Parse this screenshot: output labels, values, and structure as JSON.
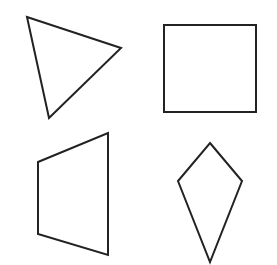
{
  "canvas": {
    "width": 277,
    "height": 265,
    "background_color": "#ffffff",
    "stroke_color": "#222222",
    "stroke_width": 2
  },
  "shapes": [
    {
      "name": "triangle",
      "description": "scalene triangle rotated, apex pointing right-down, top-left quadrant",
      "points": "27,17 121,48 49,118"
    },
    {
      "name": "square",
      "description": "axis-aligned square, top-right quadrant",
      "points": "164,25 256,25 256,112 164,112"
    },
    {
      "name": "trapezoid",
      "description": "quadrilateral with two vertical parallel sides, shorter left side, bottom-left quadrant",
      "points": "38,162 108,133 108,255 38,234"
    },
    {
      "name": "kite",
      "description": "kite-shaped quadrilateral, long point downward, bottom-right quadrant",
      "points": "210,143 242,181 210,262 178,181"
    }
  ]
}
